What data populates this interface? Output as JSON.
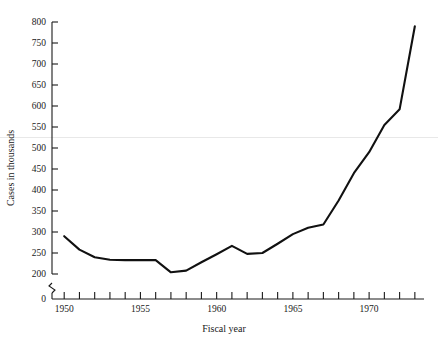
{
  "chart_data": {
    "type": "line",
    "title": "",
    "subtitle": "",
    "xlabel": "Fiscal year",
    "ylabel": "Cases in thousands",
    "xlim": [
      1949.2,
      1973.6
    ],
    "ylim": [
      200,
      800
    ],
    "y_axis_break": true,
    "y_break_label": "0",
    "grid": false,
    "gridline_value": 525,
    "legend": "none",
    "line_color": "#111111",
    "gridline_color": "#e8e8e8",
    "x": [
      1950,
      1951,
      1952,
      1953,
      1954,
      1955,
      1956,
      1957,
      1958,
      1959,
      1960,
      1961,
      1962,
      1963,
      1964,
      1965,
      1966,
      1967,
      1968,
      1969,
      1970,
      1971,
      1972,
      1973
    ],
    "values": [
      290,
      258,
      240,
      234,
      233,
      233,
      233,
      204,
      208,
      228,
      247,
      267,
      248,
      250,
      272,
      295,
      310,
      318,
      375,
      440,
      490,
      555,
      592,
      790
    ],
    "y_ticks": [
      200,
      250,
      300,
      350,
      400,
      450,
      500,
      550,
      600,
      650,
      700,
      750,
      800
    ],
    "y_tick_labels": [
      "200",
      "250",
      "300",
      "350",
      "400",
      "450",
      "500",
      "550",
      "600",
      "650",
      "700",
      "750",
      "800"
    ],
    "x_ticks": [
      1950,
      1951,
      1952,
      1953,
      1954,
      1955,
      1956,
      1957,
      1958,
      1959,
      1960,
      1961,
      1962,
      1963,
      1964,
      1965,
      1966,
      1967,
      1968,
      1969,
      1970,
      1971,
      1972,
      1973
    ],
    "x_tick_labels_shown": [
      "1950",
      "1955",
      "1960",
      "1965",
      "1970"
    ],
    "x_tick_labels_values": [
      1950,
      1955,
      1960,
      1965,
      1970
    ]
  },
  "axes": {
    "y_label": "Cases in thousands",
    "x_label": "Fiscal year",
    "zero_label": "0"
  }
}
